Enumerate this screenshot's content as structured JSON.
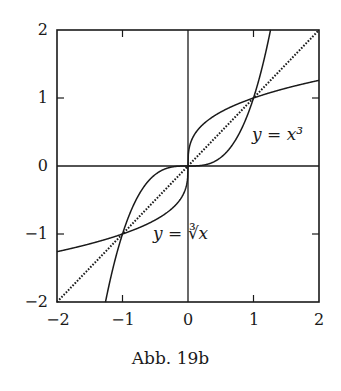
{
  "chart_data": {
    "type": "line",
    "title": "",
    "caption": "Abb. 19b",
    "xlabel": "",
    "ylabel": "",
    "xlim": [
      -2,
      2
    ],
    "ylim": [
      -2,
      2
    ],
    "x_ticks": [
      "-2",
      "-1",
      "0",
      "1",
      "2"
    ],
    "y_ticks": [
      "2",
      "1",
      "0",
      "-1",
      "-2"
    ],
    "grid": false,
    "axes_lines": [
      "x = 0",
      "y = 0"
    ],
    "series": [
      {
        "name": "y = x^3",
        "style": "solid",
        "function": "x^3",
        "x": [
          -1.26,
          -1,
          -0.5,
          0,
          0.5,
          1,
          1.26
        ],
        "values": [
          -2,
          -1,
          -0.125,
          0,
          0.125,
          1,
          2
        ]
      },
      {
        "name": "y = cbrt(x)",
        "style": "solid",
        "function": "cbrt(x)",
        "x": [
          -2,
          -1,
          -0.125,
          0,
          0.125,
          1,
          2
        ],
        "values": [
          -1.26,
          -1,
          -0.5,
          0,
          0.5,
          1,
          1.26
        ]
      },
      {
        "name": "y = x",
        "style": "dotted",
        "function": "x",
        "x": [
          -2,
          2
        ],
        "values": [
          -2,
          2
        ]
      }
    ],
    "annotations": [
      {
        "text": "y = x³",
        "x": 1.4,
        "y": 0.45
      },
      {
        "text": "y = ∛x",
        "x": -0.5,
        "y": -1.2
      }
    ]
  },
  "labels": {
    "x_ticks": [
      "−2",
      "−1",
      "0",
      "1",
      "2"
    ],
    "y_ticks": [
      "2",
      "1",
      "0",
      "−1",
      "−2"
    ],
    "annot_cube": "y = x³",
    "annot_cbrt": "y = ∛x",
    "caption": "Abb. 19b"
  }
}
